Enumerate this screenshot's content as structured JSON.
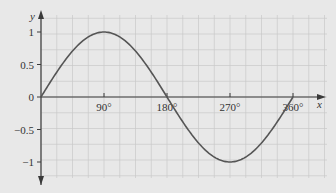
{
  "chart_data": {
    "type": "line",
    "title": "",
    "xlabel": "x",
    "ylabel": "y",
    "x_ticks": [
      "90°",
      "180°",
      "270°",
      "360°"
    ],
    "y_ticks": [
      "1",
      "0.5",
      "0",
      "-0.5",
      "-1"
    ],
    "xlim": [
      0,
      360
    ],
    "ylim": [
      -1,
      1
    ],
    "grid": true,
    "series": [
      {
        "name": "y = sin x",
        "x": [
          0,
          30,
          60,
          90,
          120,
          150,
          180,
          210,
          240,
          270,
          300,
          330,
          360
        ],
        "values": [
          0,
          0.5,
          0.866,
          1,
          0.866,
          0.5,
          0,
          -0.5,
          -0.866,
          -1,
          -0.866,
          -0.5,
          0
        ]
      }
    ]
  },
  "colors": {
    "background": "#e8e8e8",
    "grid": "#c8c8c8",
    "axis": "#3a3a3a",
    "curve": "#555555"
  }
}
